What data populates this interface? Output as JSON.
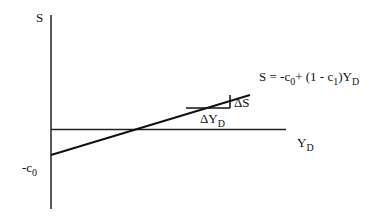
{
  "diagram": {
    "type": "economics-savings-function",
    "y_axis": {
      "label": "S"
    },
    "x_axis": {
      "label_main": "Y",
      "label_sub": "D"
    },
    "intercept": {
      "label_main": "-c",
      "label_sub": "0"
    },
    "equation": {
      "part1": "S = -c",
      "sub1": "0",
      "part2": "+ (1 - c",
      "sub2": "1",
      "part3": ")Y",
      "sub3": "D"
    },
    "slope_triangle": {
      "rise_label": "ΔS",
      "run_label_main": "ΔY",
      "run_label_sub": "D"
    },
    "colors": {
      "line": "#111111",
      "background": "#ffffff"
    }
  }
}
